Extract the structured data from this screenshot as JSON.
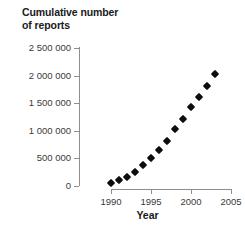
{
  "chart_data": {
    "type": "scatter",
    "title": "",
    "ylabel": "Cumulative number of reports",
    "ylabel_lines": [
      "Cumulative number",
      "of reports"
    ],
    "xlabel": "Year",
    "xlim": [
      1988.5,
      2005.5
    ],
    "ylim": [
      0,
      2500000
    ],
    "grid": false,
    "legend": null,
    "x_ticks": [
      1990,
      1995,
      2000,
      2005
    ],
    "x_tick_labels": [
      "1990",
      "1995",
      "2000",
      "2005"
    ],
    "y_ticks": [
      0,
      500000,
      1000000,
      1500000,
      2000000,
      2500000
    ],
    "y_tick_labels": [
      "0",
      "500 000",
      "1 000 000",
      "1 500 000",
      "2 000 000",
      "2 500 000"
    ],
    "marker": "diamond",
    "marker_color": "#0d0d0d",
    "x": [
      1990,
      1991,
      1992,
      1993,
      1994,
      1995,
      1996,
      1997,
      1998,
      1999,
      2000,
      2001,
      2002,
      2003
    ],
    "values": [
      60000,
      110000,
      165000,
      255000,
      380000,
      500000,
      650000,
      820000,
      1030000,
      1205000,
      1430000,
      1610000,
      1820000,
      2020000
    ]
  },
  "axis_colors": {
    "spine": "#8e8e8e",
    "tick_label": "#3a3a3a",
    "axis_title": "#1a1a1a",
    "background": "#ffffff"
  }
}
